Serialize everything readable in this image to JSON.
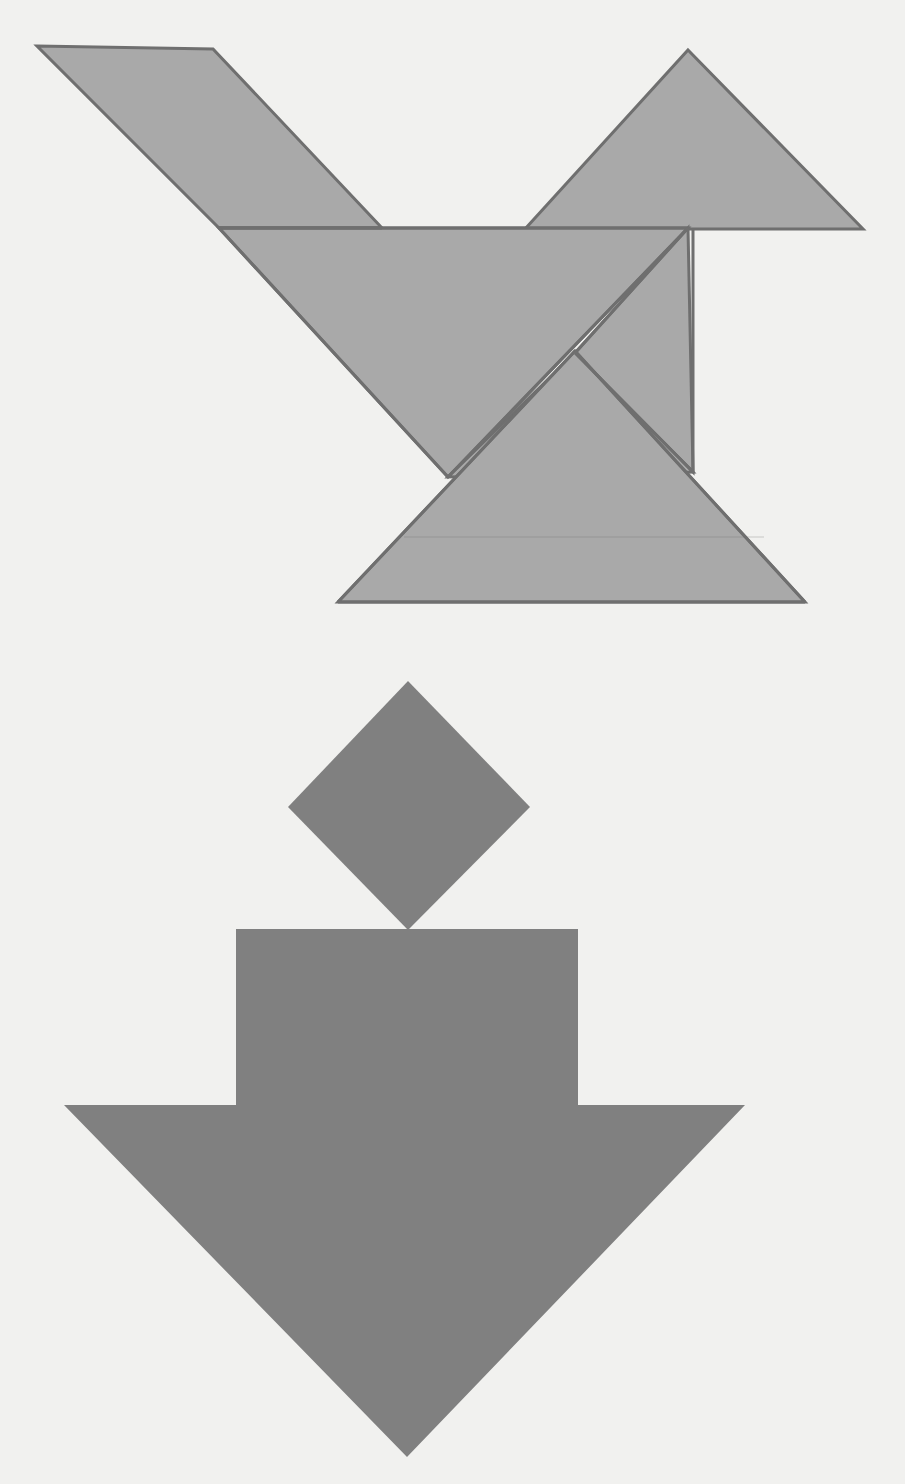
{
  "canvas": {
    "width": 905,
    "height": 1484,
    "background_color": "#f1f1ef",
    "title": "tangram-bird-figure-with-down-arrow"
  },
  "palette": {
    "piece_fill": "#a9a9a9",
    "piece_stroke": "#6f6f6f",
    "piece_stroke_width": 3,
    "arrow_fill": "#808080",
    "diamond_fill": "#808080",
    "background": "#f1f1ef"
  },
  "figures": [
    {
      "id": "tangram-assembly",
      "label": "tangram-assembly",
      "description": "Seven-piece tangram arranged as a bird-like figure",
      "piece_count": 7,
      "bounds": {
        "x": 37,
        "y": 46,
        "width": 828,
        "height": 558
      }
    },
    {
      "id": "down-arrow-group",
      "label": "down-arrow-group",
      "description": "Solid gray downward arrow below a rotated square",
      "bounds": {
        "x": 62,
        "y": 680,
        "width": 684,
        "height": 778
      }
    }
  ],
  "tangram_pieces": [
    {
      "name": "parallelogram-wing",
      "shape": "parallelogram",
      "points": "37,46 213,49 382,228 219,228",
      "fill": "#a9a9a9",
      "stroke": "#6f6f6f"
    },
    {
      "name": "medium-triangle-head",
      "shape": "triangle",
      "points": "688,50 863,229 525,229",
      "fill": "#a9a9a9",
      "stroke": "#6f6f6f"
    },
    {
      "name": "large-triangle-body",
      "shape": "triangle",
      "points": "219,228 688,228 448,477",
      "fill": "#a9a9a9",
      "stroke": "#6f6f6f"
    },
    {
      "name": "small-triangle-upper-right",
      "shape": "triangle",
      "points": "688,228 693,472 575,353",
      "fill": "#a9a9a9",
      "stroke": "#6f6f6f"
    },
    {
      "name": "small-triangle-inner",
      "shape": "triangle",
      "points": "575,353 693,472 448,477",
      "fill": "#a9a9a9",
      "stroke": "#6f6f6f"
    },
    {
      "name": "large-triangle-tail",
      "shape": "triangle",
      "points": "575,351 805,602 338,602",
      "fill": "#a9a9a9",
      "stroke": "#6f6f6f"
    },
    {
      "name": "square-piece",
      "shape": "square",
      "points": "688,228 693,472 575,353",
      "fill": "#a9a9a9",
      "stroke": "#6f6f6f"
    }
  ],
  "tangram_outline": {
    "name": "tangram-outline",
    "points": "37,46 213,49 382,228 525,229 688,50 863,229 693,230 693,472 805,602 338,602 448,477 219,228"
  },
  "tangram_internal_edges": [
    {
      "name": "edge-parallelogram-base",
      "x1": 219,
      "y1": 228,
      "x2": 382,
      "y2": 228
    },
    {
      "name": "edge-body-top",
      "x1": 219,
      "y1": 228,
      "x2": 688,
      "y2": 228
    },
    {
      "name": "edge-body-left-diagonal",
      "x1": 219,
      "y1": 228,
      "x2": 448,
      "y2": 477
    },
    {
      "name": "edge-body-right-diagonal",
      "x1": 688,
      "y1": 228,
      "x2": 448,
      "y2": 477
    },
    {
      "name": "edge-square-diagonal",
      "x1": 688,
      "y1": 228,
      "x2": 575,
      "y2": 353
    },
    {
      "name": "edge-square-lower",
      "x1": 575,
      "y1": 353,
      "x2": 693,
      "y2": 472
    },
    {
      "name": "edge-vertical-right",
      "x1": 693,
      "y1": 230,
      "x2": 693,
      "y2": 472
    },
    {
      "name": "edge-tail-left",
      "x1": 575,
      "y1": 351,
      "x2": 338,
      "y2": 602
    },
    {
      "name": "edge-tail-right",
      "x1": 575,
      "y1": 351,
      "x2": 805,
      "y2": 602
    },
    {
      "name": "edge-tail-base",
      "x1": 338,
      "y1": 602,
      "x2": 805,
      "y2": 602
    },
    {
      "name": "edge-faint-tail-seam",
      "x1": 404,
      "y1": 537,
      "x2": 764,
      "y2": 537
    }
  ],
  "arrow_group": {
    "diamond": {
      "name": "rotated-square-diamond",
      "points": "408,681 530,807 408,930 288,807",
      "fill": "#808080",
      "center_x": 408,
      "center_y": 806,
      "diagonal_width": 242,
      "diagonal_height": 249
    },
    "arrow": {
      "name": "down-arrow",
      "points": "236,929 578,929 578,1105 745,1105 407,1457 64,1105 236,1105",
      "fill": "#808080",
      "shaft_left": 236,
      "shaft_right": 578,
      "shaft_top": 929,
      "wing_y": 1105,
      "wing_left": 64,
      "wing_right": 745,
      "tip_x": 407,
      "tip_y": 1457
    }
  }
}
